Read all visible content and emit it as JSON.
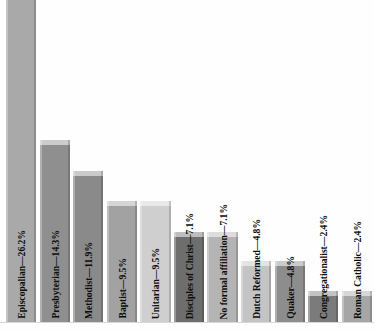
{
  "chart_data": {
    "type": "bar",
    "title": "",
    "subtitle": "",
    "xlabel": "",
    "ylabel": "",
    "grid": false,
    "legend": "none",
    "ylim": [
      0,
      28
    ],
    "axis_visible": false,
    "orientation": "vertical",
    "label_format": "{category}—{value}%",
    "categories": [
      "Episcopalian",
      "Presbyterian",
      "Methodist",
      "Baptist",
      "Unitarian",
      "Disciples of Christ",
      "No formal affiliation",
      "Dutch Reformed",
      "Quaker",
      "Congregationalist",
      "Roman Catholic"
    ],
    "values": [
      26.2,
      14.3,
      11.9,
      9.5,
      9.5,
      7.1,
      7.1,
      4.8,
      4.8,
      2.4,
      2.4
    ],
    "bar_labels": [
      "Episcopalian—26.2%",
      "Presbyterian—14.3%",
      "Methodist—11.9%",
      "Baptist—9.5%",
      "Unitarian—9.5%",
      "Disciples of Christ—7.1%",
      "No formal affiliation—7.1%",
      "Dutch Reformed—4.8%",
      "Quaker—4.8%",
      "Congregationalist—2.4%",
      "Roman Catholic—2.4%"
    ],
    "bar_colors": [
      "#a9a9a9",
      "#8f8f8f",
      "#8a8a8a",
      "#a2a2a2",
      "#cfcfcf",
      "#6e6e6e",
      "#b4b4b4",
      "#c4c4c4",
      "#8d8d8d",
      "#7b7b7b",
      "#a6a6a6"
    ],
    "background_color": "#fefefe",
    "baseline_color": "#d8d8d8"
  }
}
